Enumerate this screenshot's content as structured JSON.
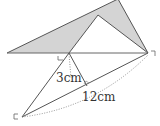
{
  "diagram": {
    "type": "geometry",
    "labels": {
      "altitude": "3cm",
      "base": "12cm"
    },
    "colors": {
      "shade": "#d4d4d4",
      "line": "#555555",
      "dotted": "#777777"
    },
    "points": {
      "A_left": [
        7,
        53
      ],
      "B_top": [
        118,
        0
      ],
      "C_right": [
        148,
        53
      ],
      "D_inner_apex": [
        98,
        15
      ],
      "E_base_point": [
        69,
        53
      ],
      "F_bottom": [
        22,
        117
      ],
      "G_foot": [
        87,
        86
      ]
    }
  }
}
